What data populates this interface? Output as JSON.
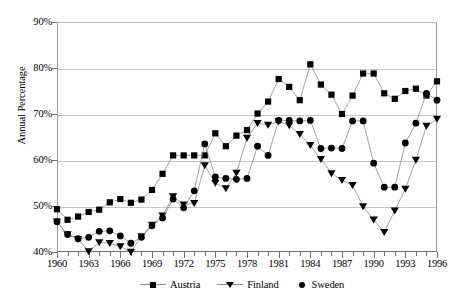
{
  "chart_data": {
    "type": "line",
    "title": "",
    "subtitle": "",
    "xlabel": "",
    "ylabel": "Annual Percentage",
    "xlim": [
      1960,
      1996
    ],
    "ylim": [
      40,
      90
    ],
    "ytick_values": [
      40,
      50,
      60,
      70,
      80,
      90
    ],
    "ytick_labels": [
      "40%",
      "50%",
      "60%",
      "70%",
      "80%",
      "90%"
    ],
    "xtick_values": [
      1960,
      1963,
      1966,
      1969,
      1972,
      1975,
      1978,
      1981,
      1984,
      1987,
      1990,
      1993,
      1996
    ],
    "xtick_labels": [
      "1960",
      "1963",
      "1966",
      "1969",
      "1972",
      "1975",
      "1978",
      "1981",
      "1984",
      "1987",
      "1990",
      "1993",
      "1996"
    ],
    "grid": true,
    "grid_axis": "y",
    "legend_position": "bottom",
    "x": [
      1960,
      1961,
      1962,
      1963,
      1964,
      1965,
      1966,
      1967,
      1968,
      1969,
      1970,
      1971,
      1972,
      1973,
      1974,
      1975,
      1976,
      1977,
      1978,
      1979,
      1980,
      1981,
      1982,
      1983,
      1984,
      1985,
      1986,
      1987,
      1988,
      1989,
      1990,
      1991,
      1992,
      1993,
      1994,
      1995,
      1996
    ],
    "series": [
      {
        "name": "Austria",
        "marker": "square",
        "values": [
          49.3,
          47.0,
          47.7,
          48.7,
          49.2,
          50.8,
          51.5,
          50.7,
          51.4,
          53.5,
          57.0,
          61.0,
          61.0,
          61.0,
          61.0,
          65.8,
          63.0,
          65.3,
          66.5,
          70.1,
          72.7,
          77.6,
          75.9,
          73.0,
          80.8,
          76.4,
          74.2,
          70.0,
          74.0,
          78.8,
          78.8,
          74.5,
          73.3,
          75.0,
          75.5,
          74.0,
          77.1
        ]
      },
      {
        "name": "Finland",
        "marker": "triangle-down",
        "values": [
          46.6,
          43.8,
          42.8,
          40.1,
          42.1,
          41.9,
          41.2,
          40.0,
          43.4,
          45.9,
          47.9,
          52.1,
          50.3,
          50.6,
          58.8,
          55.0,
          53.8,
          57.2,
          64.8,
          68.0,
          67.6,
          68.4,
          67.5,
          65.6,
          63.2,
          60.2,
          57.1,
          55.6,
          54.5,
          49.9,
          47.0,
          44.3,
          49.0,
          53.7,
          60.0,
          67.4,
          68.9
        ]
      },
      {
        "name": "Sweden",
        "marker": "circle",
        "values": [
          46.6,
          43.8,
          42.9,
          43.2,
          44.5,
          44.6,
          43.5,
          41.9,
          43.2,
          45.7,
          47.4,
          51.5,
          49.6,
          53.3,
          63.5,
          56.3,
          56.0,
          55.8,
          56.0,
          63.0,
          61.0,
          68.6,
          68.6,
          68.5,
          68.6,
          62.5,
          62.6,
          62.5,
          68.5,
          68.5,
          59.3,
          54.1,
          54.1,
          63.7,
          68.0,
          74.5,
          73.0
        ]
      }
    ]
  },
  "legend": {
    "items": [
      {
        "label": "Austria",
        "marker": "square"
      },
      {
        "label": "Finland",
        "marker": "triangle-down"
      },
      {
        "label": "Sweden",
        "marker": "circle"
      }
    ]
  }
}
